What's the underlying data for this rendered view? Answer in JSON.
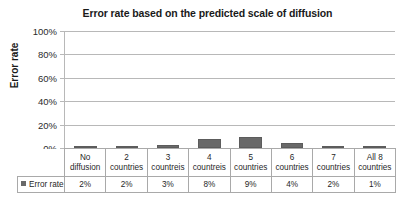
{
  "chart_data": {
    "type": "bar",
    "title": "Error rate based on the predicted scale of diffusion",
    "xlabel": "",
    "ylabel": "Error rate",
    "ylim": [
      0,
      100
    ],
    "ytick_labels": [
      "100%",
      "80%",
      "60%",
      "40%",
      "20%",
      "0%"
    ],
    "yticks": [
      100,
      80,
      60,
      40,
      20,
      0
    ],
    "grid": true,
    "legend": [
      "Error rate"
    ],
    "legend_position": "data-table-row",
    "categories": [
      "No diffusion",
      "2 countries",
      "3 countreis",
      "4 countreis",
      "5 countries",
      "6 countries",
      "7 countries",
      "All 8 countries"
    ],
    "category_lines": [
      [
        "No",
        "diffusion"
      ],
      [
        "2",
        "countries"
      ],
      [
        "3",
        "countreis"
      ],
      [
        "4",
        "countreis"
      ],
      [
        "5",
        "countries"
      ],
      [
        "6",
        "countries"
      ],
      [
        "7",
        "countries"
      ],
      [
        "All 8",
        "countries"
      ]
    ],
    "values": [
      2,
      2,
      3,
      8,
      9,
      4,
      2,
      1
    ],
    "value_labels": [
      "2%",
      "2%",
      "3%",
      "8%",
      "9%",
      "4%",
      "2%",
      "1%"
    ],
    "series_name": "Error rate",
    "bar_color": "#696969",
    "gridline_color": "#b8b8b8"
  },
  "table": {
    "legend_label": "Error rate"
  }
}
